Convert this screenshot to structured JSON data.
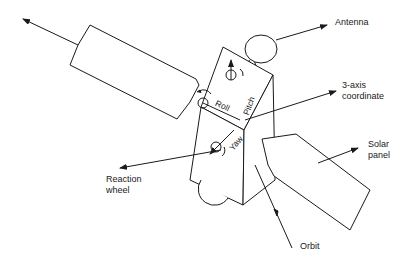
{
  "diagram": {
    "labels": {
      "antenna": "Antenna",
      "coordinate": "3-axis\ncoordinate",
      "reaction_wheel": "Reaction\nwheel",
      "solar_panel": "Solar\npanel",
      "orbit": "Orbit"
    },
    "axes": {
      "roll": "Roll",
      "pitch": "Pitch",
      "yaw": "Yaw"
    },
    "colors": {
      "line": "#1a1a1a",
      "background": "#ffffff"
    }
  }
}
